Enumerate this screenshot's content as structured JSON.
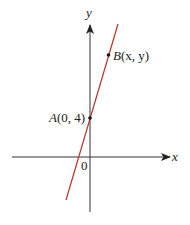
{
  "diagram": {
    "type": "coordinate-plane-line",
    "axes": {
      "x_label": "x",
      "y_label": "y",
      "origin_label": "0",
      "axis_color": "#333333"
    },
    "line": {
      "color": "#b5332a",
      "description": "straight line through A and B with positive slope"
    },
    "points": [
      {
        "name": "A",
        "label_letter": "A",
        "label_coords": "(0, 4)",
        "x": 0,
        "y": 4
      },
      {
        "name": "B",
        "label_letter": "B",
        "label_coords": "(x, y)",
        "x": "x",
        "y": "y"
      }
    ]
  }
}
